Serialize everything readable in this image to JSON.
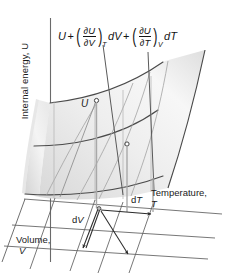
{
  "figure": {
    "type": "3d-surface-diagram"
  },
  "axes": {
    "vertical": {
      "name": "Internal energy, U",
      "label": "Internal energy, U"
    },
    "depth": {
      "name": "Volume, V",
      "label": "Volume,",
      "symbol": "V"
    },
    "horizontal": {
      "name": "Temperature, T",
      "label": "Temperature,",
      "symbol": "T"
    }
  },
  "formula": {
    "base": "U",
    "plus1": "+",
    "open1": "(",
    "num1": "∂U",
    "den1": "∂V",
    "close1": ")",
    "sub1": "T",
    "diff1": "dV",
    "plus2": "+",
    "open2": "(",
    "num2": "∂U",
    "den2": "∂T",
    "close2": ")",
    "sub2": "V",
    "diff2": "dT",
    "plain": "U + (∂U/∂V)_T dV + (∂U/∂T)_V dT"
  },
  "annotations": {
    "point_u": "U",
    "delta_v": "dV",
    "delta_t": "dT"
  },
  "colors": {
    "surface_light": "#f2f2f2",
    "surface_mid": "#e2e2e2",
    "surface_dark": "#d2d2d2",
    "curve": "#4a4a4a",
    "grid_line": "#9a9a9a",
    "base_line": "#5a5a5a",
    "text": "#1a1a1a",
    "background": "#ffffff"
  }
}
